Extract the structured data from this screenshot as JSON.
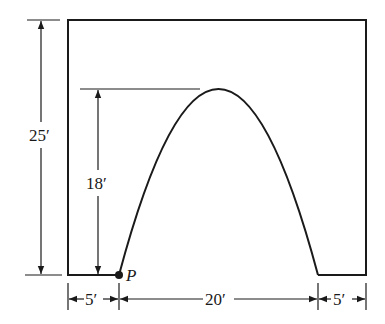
{
  "diagram": {
    "type": "arch-in-rectangle-dimension-drawing",
    "colors": {
      "stroke": "#1a1a1a",
      "background": "#ffffff"
    },
    "labels": {
      "total_height": "25′",
      "arch_height": "18′",
      "left_margin": "5′",
      "arch_span": "20′",
      "right_margin": "5′",
      "point": "P"
    },
    "dimensions": {
      "total_height_ft": 25,
      "arch_height_ft": 18,
      "left_margin_ft": 5,
      "arch_span_ft": 20,
      "right_margin_ft": 5
    }
  }
}
